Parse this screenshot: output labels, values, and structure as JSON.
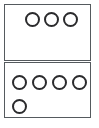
{
  "diagram": {
    "background_color": "#ffffff",
    "border_color": "#555a5e",
    "dot_outline_color": "#2b2b2d",
    "dot_fill": "none",
    "total_dots": 8,
    "groups": [
      {
        "id": "top-group",
        "name": "Top box",
        "dot_count": 3,
        "rows": [
          {
            "row_index": 0,
            "dot_count": 3,
            "dots": [
              {
                "label": "dot-1",
                "x": 24,
                "y": 11,
                "d": 15
              },
              {
                "label": "dot-2",
                "x": 43,
                "y": 11,
                "d": 15
              },
              {
                "label": "dot-3",
                "x": 62,
                "y": 11,
                "d": 15
              }
            ]
          }
        ],
        "box": {
          "x": 4,
          "y": 4,
          "w": 87,
          "h": 57
        }
      },
      {
        "id": "bottom-group",
        "name": "Bottom box",
        "dot_count": 5,
        "rows": [
          {
            "row_index": 0,
            "dot_count": 4,
            "dots": [
              {
                "label": "dot-1",
                "x": 11,
                "y": 74,
                "d": 15
              },
              {
                "label": "dot-2",
                "x": 31,
                "y": 74,
                "d": 15
              },
              {
                "label": "dot-3",
                "x": 51,
                "y": 74,
                "d": 15
              },
              {
                "label": "dot-4",
                "x": 71,
                "y": 74,
                "d": 15
              }
            ]
          },
          {
            "row_index": 1,
            "dot_count": 1,
            "dots": [
              {
                "label": "dot-5",
                "x": 11,
                "y": 98,
                "d": 15
              }
            ]
          }
        ],
        "box": {
          "x": 4,
          "y": 62,
          "w": 87,
          "h": 56
        }
      }
    ]
  }
}
